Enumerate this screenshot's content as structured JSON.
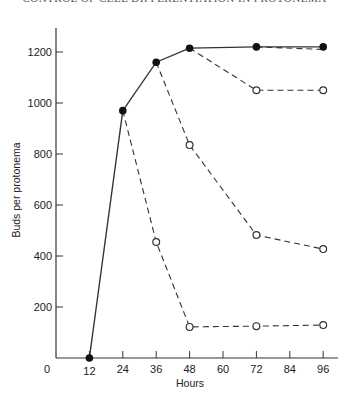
{
  "header": {
    "running_title": "CONTROL OF CELL DIFFERENTIATION IN PROTONEMA"
  },
  "chart_data": {
    "type": "line",
    "title": "",
    "xlabel": "Hours",
    "ylabel": "Buds per protonema",
    "xlim": [
      0,
      100
    ],
    "ylim": [
      0,
      1300
    ],
    "x_ticks": [
      0,
      12,
      24,
      36,
      48,
      60,
      72,
      84,
      96
    ],
    "y_ticks": [
      200,
      400,
      600,
      800,
      1000,
      1200
    ],
    "y_zero_label": "0",
    "grid": false,
    "legend": null,
    "series": [
      {
        "name": "Control (continuous)",
        "style": "solid",
        "marker": "filled-circle",
        "x": [
          12,
          24,
          36,
          48,
          72,
          96
        ],
        "y": [
          0,
          970,
          1160,
          1215,
          1220,
          1220
        ]
      },
      {
        "name": "Transferred at 72 h",
        "style": "dashed",
        "marker": "open-circle",
        "x": [
          72,
          96
        ],
        "y": [
          1220,
          1210
        ]
      },
      {
        "name": "Transferred at 48 h",
        "style": "dashed",
        "marker": "open-circle",
        "x": [
          48,
          72,
          96
        ],
        "y": [
          1215,
          1050,
          1050
        ]
      },
      {
        "name": "Transferred at 36 h",
        "style": "dashed",
        "marker": "open-circle",
        "x": [
          36,
          48,
          72,
          96
        ],
        "y": [
          1160,
          835,
          482,
          427
        ]
      },
      {
        "name": "Transferred at 24 h",
        "style": "dashed",
        "marker": "open-circle",
        "x": [
          24,
          36,
          48,
          72,
          96
        ],
        "y": [
          970,
          455,
          122,
          125,
          129
        ]
      }
    ]
  }
}
